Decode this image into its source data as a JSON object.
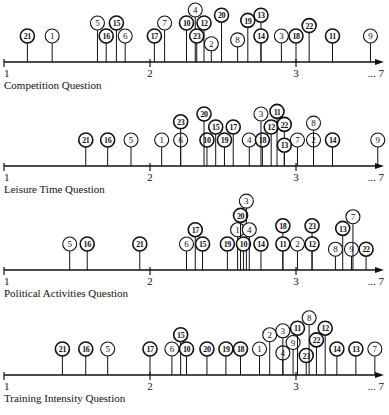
{
  "figure": {
    "width": 389,
    "height": 415,
    "axis": {
      "x_at_1": 4,
      "px_per_unit": 146,
      "x_end": 384,
      "end_label": "... 7",
      "ticks": [
        "1",
        "2",
        "3"
      ]
    },
    "colors": {
      "ink": "#111111",
      "background": "#ffffff"
    }
  },
  "chart_data": [
    {
      "type": "scatter",
      "title": "Competition Question",
      "xlabel": "",
      "ylabel": "",
      "xlim": [
        1,
        7
      ],
      "x_ticks": [
        "1",
        "2",
        "3",
        "...7"
      ],
      "axis_y": 62,
      "caption_y": 80,
      "points": [
        {
          "id": "21",
          "x": 1.16,
          "level": 0
        },
        {
          "id": "1",
          "x": 1.33,
          "level": 0
        },
        {
          "id": "5",
          "x": 1.64,
          "level": 1
        },
        {
          "id": "16",
          "x": 1.7,
          "level": 0
        },
        {
          "id": "15",
          "x": 1.77,
          "level": 1
        },
        {
          "id": "6",
          "x": 1.83,
          "level": 0
        },
        {
          "id": "17",
          "x": 2.03,
          "level": 0
        },
        {
          "id": "7",
          "x": 2.1,
          "level": 1
        },
        {
          "id": "10",
          "x": 2.25,
          "level": 1
        },
        {
          "id": "4",
          "x": 2.31,
          "level": 2
        },
        {
          "id": "23",
          "x": 2.32,
          "level": 0
        },
        {
          "id": "12",
          "x": 2.37,
          "level": 1
        },
        {
          "id": "2",
          "x": 2.42,
          "level": -0.6
        },
        {
          "id": "20",
          "x": 2.49,
          "level": 1.6
        },
        {
          "id": "8",
          "x": 2.6,
          "level": -0.3
        },
        {
          "id": "19",
          "x": 2.67,
          "level": 1.2
        },
        {
          "id": "13",
          "x": 2.76,
          "level": 1.6
        },
        {
          "id": "14",
          "x": 2.76,
          "level": 0
        },
        {
          "id": "3",
          "x": 2.9,
          "level": 0
        },
        {
          "id": "18",
          "x": 3.0,
          "level": 0
        },
        {
          "id": "22",
          "x": 3.09,
          "level": 0.8
        },
        {
          "id": "11",
          "x": 3.25,
          "level": 0
        },
        {
          "id": "9",
          "x": 3.51,
          "level": 0
        }
      ]
    },
    {
      "type": "scatter",
      "title": "Leisure Time Question",
      "xlabel": "",
      "ylabel": "",
      "xlim": [
        1,
        7
      ],
      "x_ticks": [
        "1",
        "2",
        "3",
        "...7"
      ],
      "axis_y": 166,
      "caption_y": 184,
      "points": [
        {
          "id": "21",
          "x": 1.56,
          "level": 0
        },
        {
          "id": "16",
          "x": 1.71,
          "level": 0
        },
        {
          "id": "5",
          "x": 1.87,
          "level": 0
        },
        {
          "id": "1",
          "x": 2.08,
          "level": 0
        },
        {
          "id": "6",
          "x": 2.21,
          "level": 0
        },
        {
          "id": "23",
          "x": 2.21,
          "level": 1.4
        },
        {
          "id": "10",
          "x": 2.39,
          "level": 0
        },
        {
          "id": "20",
          "x": 2.37,
          "level": 2
        },
        {
          "id": "15",
          "x": 2.45,
          "level": 1
        },
        {
          "id": "19",
          "x": 2.51,
          "level": 0
        },
        {
          "id": "17",
          "x": 2.57,
          "level": 1
        },
        {
          "id": "4",
          "x": 2.68,
          "level": 0
        },
        {
          "id": "18",
          "x": 2.77,
          "level": 0
        },
        {
          "id": "3",
          "x": 2.76,
          "level": 2
        },
        {
          "id": "12",
          "x": 2.83,
          "level": 1
        },
        {
          "id": "11",
          "x": 2.87,
          "level": 2.2
        },
        {
          "id": "22",
          "x": 2.92,
          "level": 1.2
        },
        {
          "id": "13",
          "x": 2.92,
          "level": -0.4
        },
        {
          "id": "7",
          "x": 3.01,
          "level": 0
        },
        {
          "id": "2",
          "x": 3.12,
          "level": 0
        },
        {
          "id": "8",
          "x": 3.12,
          "level": 1.3
        },
        {
          "id": "14",
          "x": 3.25,
          "level": 0
        },
        {
          "id": "9",
          "x": 3.56,
          "level": 0
        }
      ]
    },
    {
      "type": "scatter",
      "title": "Political Activities Question",
      "xlabel": "",
      "ylabel": "",
      "xlim": [
        1,
        7
      ],
      "x_ticks": [
        "1",
        "2",
        "3",
        "...7"
      ],
      "axis_y": 270,
      "caption_y": 288,
      "points": [
        {
          "id": "5",
          "x": 1.45,
          "level": 0
        },
        {
          "id": "16",
          "x": 1.57,
          "level": 0
        },
        {
          "id": "21",
          "x": 1.93,
          "level": 0
        },
        {
          "id": "6",
          "x": 2.25,
          "level": 0
        },
        {
          "id": "17",
          "x": 2.31,
          "level": 1.1
        },
        {
          "id": "15",
          "x": 2.36,
          "level": 0
        },
        {
          "id": "19",
          "x": 2.53,
          "level": 0
        },
        {
          "id": "1",
          "x": 2.6,
          "level": 1.1
        },
        {
          "id": "20",
          "x": 2.62,
          "level": 2.2
        },
        {
          "id": "3",
          "x": 2.66,
          "level": 3.3
        },
        {
          "id": "10",
          "x": 2.64,
          "level": 0
        },
        {
          "id": "4",
          "x": 2.68,
          "level": 1.1
        },
        {
          "id": "14",
          "x": 2.76,
          "level": 0
        },
        {
          "id": "18",
          "x": 2.91,
          "level": 1.4
        },
        {
          "id": "11",
          "x": 2.91,
          "level": 0
        },
        {
          "id": "2",
          "x": 3.01,
          "level": 0
        },
        {
          "id": "23",
          "x": 3.11,
          "level": 1.4
        },
        {
          "id": "12",
          "x": 3.11,
          "level": 0
        },
        {
          "id": "8",
          "x": 3.27,
          "level": -0.4
        },
        {
          "id": "13",
          "x": 3.32,
          "level": 1.2
        },
        {
          "id": "9",
          "x": 3.38,
          "level": -0.4
        },
        {
          "id": "7",
          "x": 3.39,
          "level": 2.1
        },
        {
          "id": "22",
          "x": 3.48,
          "level": -0.4
        }
      ]
    },
    {
      "type": "scatter",
      "title": "Training Intensity Question",
      "xlabel": "",
      "ylabel": "",
      "xlim": [
        1,
        7
      ],
      "x_ticks": [
        "1",
        "2",
        "3",
        "...7"
      ],
      "axis_y": 375,
      "caption_y": 393,
      "points": [
        {
          "id": "21",
          "x": 1.4,
          "level": 0
        },
        {
          "id": "16",
          "x": 1.56,
          "level": 0
        },
        {
          "id": "5",
          "x": 1.71,
          "level": 0
        },
        {
          "id": "17",
          "x": 2.0,
          "level": 0
        },
        {
          "id": "6",
          "x": 2.15,
          "level": 0
        },
        {
          "id": "15",
          "x": 2.21,
          "level": 1.1
        },
        {
          "id": "10",
          "x": 2.25,
          "level": 0
        },
        {
          "id": "20",
          "x": 2.39,
          "level": 0
        },
        {
          "id": "19",
          "x": 2.52,
          "level": 0
        },
        {
          "id": "18",
          "x": 2.62,
          "level": 0
        },
        {
          "id": "1",
          "x": 2.75,
          "level": 0
        },
        {
          "id": "2",
          "x": 2.82,
          "level": 1.1
        },
        {
          "id": "4",
          "x": 2.91,
          "level": -0.3
        },
        {
          "id": "3",
          "x": 2.91,
          "level": 1.4
        },
        {
          "id": "9",
          "x": 2.98,
          "level": 0.5
        },
        {
          "id": "11",
          "x": 3.01,
          "level": 1.6
        },
        {
          "id": "23",
          "x": 3.07,
          "level": -0.5
        },
        {
          "id": "8",
          "x": 3.09,
          "level": 2.4
        },
        {
          "id": "22",
          "x": 3.14,
          "level": 0.7
        },
        {
          "id": "12",
          "x": 3.2,
          "level": 1.6
        },
        {
          "id": "14",
          "x": 3.28,
          "level": 0
        },
        {
          "id": "13",
          "x": 3.41,
          "level": 0
        },
        {
          "id": "7",
          "x": 3.54,
          "level": 0
        }
      ]
    }
  ]
}
